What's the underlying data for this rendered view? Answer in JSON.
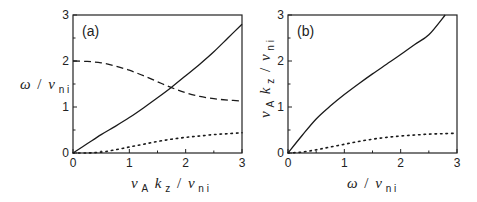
{
  "chart_data": [
    {
      "type": "line",
      "panel_label": "(a)",
      "xlabel": "v_A k_z / ν_ni",
      "ylabel": "ω / ν_ni",
      "xlim": [
        0,
        3
      ],
      "ylim": [
        0,
        3
      ],
      "xticks": [
        "0",
        "1",
        "2",
        "3"
      ],
      "yticks": [
        "0",
        "1",
        "2",
        "3"
      ],
      "grid": false,
      "legend": null,
      "series": [
        {
          "name": "solid",
          "style": "solid",
          "x": [
            0,
            0.25,
            0.5,
            0.75,
            1.0,
            1.25,
            1.5,
            1.75,
            2.0,
            2.25,
            2.5,
            2.75,
            3.0
          ],
          "y": [
            0,
            0.2,
            0.4,
            0.58,
            0.77,
            0.98,
            1.2,
            1.43,
            1.68,
            1.93,
            2.2,
            2.5,
            2.8
          ]
        },
        {
          "name": "dashed",
          "style": "dashed",
          "x": [
            0,
            0.25,
            0.5,
            0.75,
            1.0,
            1.25,
            1.5,
            1.75,
            2.0,
            2.25,
            2.5,
            2.75,
            3.0
          ],
          "y": [
            2.0,
            1.99,
            1.96,
            1.89,
            1.8,
            1.68,
            1.55,
            1.42,
            1.31,
            1.23,
            1.18,
            1.15,
            1.13
          ]
        },
        {
          "name": "dotted",
          "style": "dotted",
          "x": [
            0,
            0.25,
            0.5,
            0.75,
            1.0,
            1.25,
            1.5,
            1.75,
            2.0,
            2.25,
            2.5,
            2.75,
            3.0
          ],
          "y": [
            0,
            0.0,
            0.02,
            0.07,
            0.13,
            0.19,
            0.25,
            0.3,
            0.34,
            0.37,
            0.4,
            0.42,
            0.44
          ]
        }
      ]
    },
    {
      "type": "line",
      "panel_label": "(b)",
      "xlabel": "ω / ν_ni",
      "ylabel": "v_A k_z / ν_ni",
      "xlim": [
        0,
        3
      ],
      "ylim": [
        0,
        3
      ],
      "xticks": [
        "0",
        "1",
        "2",
        "3"
      ],
      "yticks": [
        "0",
        "1",
        "2",
        "3"
      ],
      "grid": false,
      "legend": null,
      "series": [
        {
          "name": "solid",
          "style": "solid",
          "x": [
            0,
            0.25,
            0.5,
            0.75,
            1.0,
            1.25,
            1.5,
            1.75,
            2.0,
            2.25,
            2.5,
            2.79
          ],
          "y": [
            0,
            0.38,
            0.74,
            1.02,
            1.27,
            1.5,
            1.72,
            1.93,
            2.14,
            2.36,
            2.57,
            3.0
          ]
        },
        {
          "name": "dotted",
          "style": "dotted",
          "x": [
            0,
            0.25,
            0.5,
            0.75,
            1.0,
            1.25,
            1.5,
            1.75,
            2.0,
            2.25,
            2.5,
            2.75,
            3.0
          ],
          "y": [
            0,
            0.02,
            0.07,
            0.13,
            0.19,
            0.25,
            0.3,
            0.34,
            0.37,
            0.39,
            0.41,
            0.42,
            0.43
          ]
        }
      ]
    }
  ],
  "labels": {
    "panel_a": "(a)",
    "panel_b": "(b)",
    "omega": "ω",
    "slash": "/",
    "nu": "ν",
    "v": "v",
    "k": "k",
    "sub_ni": "n i",
    "sub_A": "A",
    "sub_z": "z"
  }
}
